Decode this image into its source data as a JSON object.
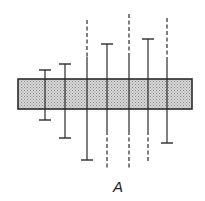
{
  "figure": {
    "label": "A",
    "colors": {
      "stroke": "#2a2a2a",
      "band_fill": "#c8c8c8",
      "background": "#ffffff"
    }
  },
  "band": {
    "x": 18,
    "y": 79,
    "width": 174,
    "height": 30
  },
  "lines": [
    {
      "x": 45,
      "top": 70,
      "bottom": 120,
      "top_style": "cap",
      "bottom_style": "cap"
    },
    {
      "x": 65,
      "top": 64,
      "bottom": 138,
      "top_style": "cap",
      "bottom_style": "cap"
    },
    {
      "x": 87,
      "top": 20,
      "bottom": 160,
      "top_style": "dashed",
      "bottom_style": "cap"
    },
    {
      "x": 107,
      "top": 44,
      "bottom": 170,
      "top_style": "cap",
      "bottom_style": "dashed"
    },
    {
      "x": 129,
      "top": 14,
      "bottom": 170,
      "top_style": "dashed",
      "bottom_style": "dashed"
    },
    {
      "x": 148,
      "top": 39,
      "bottom": 162,
      "top_style": "cap",
      "bottom_style": "dashed"
    },
    {
      "x": 167,
      "top": 18,
      "bottom": 143,
      "top_style": "dashed",
      "bottom_style": "cap"
    }
  ]
}
